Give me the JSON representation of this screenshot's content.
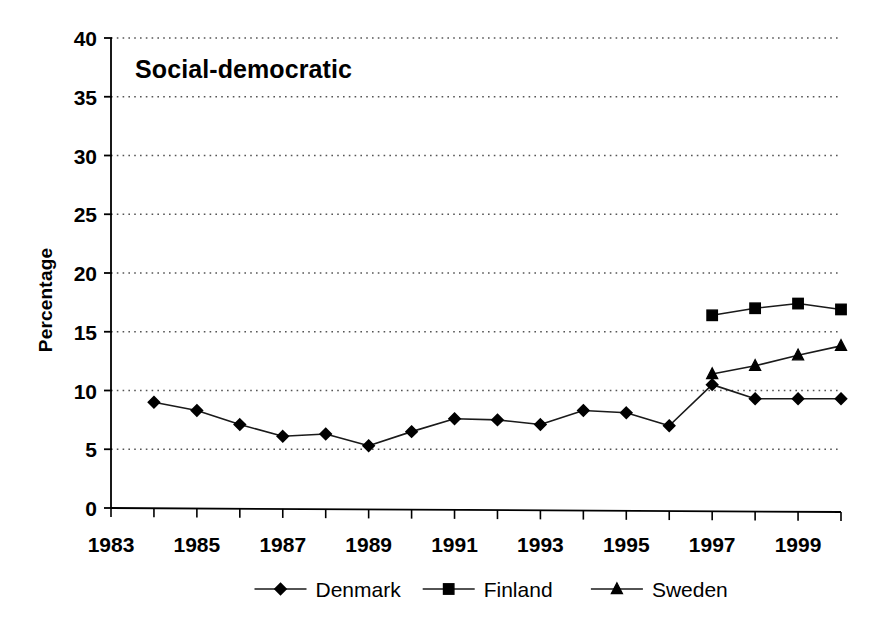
{
  "chart_data": {
    "type": "line",
    "title": "Social-democratic",
    "xlabel": "",
    "ylabel": "Percentage",
    "ylim": [
      0,
      40
    ],
    "xlim": [
      1983,
      2000
    ],
    "yticks": [
      0,
      5,
      10,
      15,
      20,
      25,
      30,
      35,
      40
    ],
    "ytick_labels": [
      "0",
      "5",
      "10",
      "15",
      "20",
      "25",
      "30",
      "35",
      "40"
    ],
    "xticks": [
      1983,
      1984,
      1985,
      1986,
      1987,
      1988,
      1989,
      1990,
      1991,
      1992,
      1993,
      1994,
      1995,
      1996,
      1997,
      1998,
      1999,
      2000
    ],
    "xtick_labels": [
      "1983",
      "",
      "1985",
      "",
      "1987",
      "",
      "1989",
      "",
      "1991",
      "",
      "1993",
      "",
      "1995",
      "",
      "1997",
      "",
      "1999",
      ""
    ],
    "xtick_labels_shown": [
      "1983",
      "1985",
      "1987",
      "1989",
      "1991",
      "1993",
      "1995",
      "1997",
      "1999"
    ],
    "grid": true,
    "grid_style": "dotted",
    "grid_axis": "y",
    "legend_position": "bottom",
    "series": [
      {
        "name": "Denmark",
        "marker": "diamond",
        "x": [
          1984,
          1985,
          1986,
          1987,
          1988,
          1989,
          1990,
          1991,
          1992,
          1993,
          1994,
          1995,
          1996,
          1997,
          1998,
          1999,
          2000
        ],
        "values": [
          9.0,
          8.3,
          7.1,
          6.1,
          6.3,
          5.3,
          6.5,
          7.6,
          7.5,
          7.1,
          8.3,
          8.1,
          7.0,
          10.5,
          9.3,
          9.3,
          9.3
        ]
      },
      {
        "name": "Finland",
        "marker": "square",
        "x": [
          1997,
          1998,
          1999,
          2000
        ],
        "values": [
          16.4,
          17.0,
          17.4,
          16.9
        ]
      },
      {
        "name": "Sweden",
        "marker": "triangle",
        "x": [
          1997,
          1998,
          1999,
          2000
        ],
        "values": [
          11.4,
          12.1,
          13.0,
          13.8
        ]
      }
    ]
  },
  "colors": {
    "line": "#1a1a1a",
    "marker": "#000000",
    "grid": "#555555",
    "axis": "#000000",
    "background": "#ffffff"
  }
}
